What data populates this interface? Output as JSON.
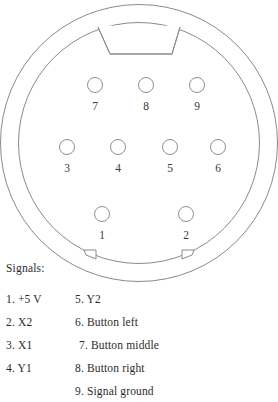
{
  "diagram": {
    "colors": {
      "outline": "#8a8a8a",
      "pin_outline": "#909090",
      "background": "#ffffff",
      "text": "#2b2b2b"
    },
    "shell": {
      "outer_circle": {
        "cx": 139,
        "cy": 143,
        "r": 139
      },
      "inner_circle": {
        "cx": 139,
        "cy": 143,
        "r": 121
      },
      "keyway_notch": "trapezoid-top",
      "bottom_tabs": 2
    },
    "pins": [
      {
        "number": "1",
        "cx": 102,
        "cy": 214
      },
      {
        "number": "2",
        "cx": 186,
        "cy": 214
      },
      {
        "number": "3",
        "cx": 67,
        "cy": 147
      },
      {
        "number": "4",
        "cx": 118,
        "cy": 147
      },
      {
        "number": "5",
        "cx": 170,
        "cy": 147
      },
      {
        "number": "6",
        "cx": 218,
        "cy": 147
      },
      {
        "number": "7",
        "cx": 95,
        "cy": 85
      },
      {
        "number": "8",
        "cx": 146,
        "cy": 85
      },
      {
        "number": "9",
        "cx": 197,
        "cy": 85
      }
    ],
    "pin_radius": 7.5
  },
  "legend": {
    "heading": "Signals:",
    "left_column": [
      "1. +5 V",
      "2. X2",
      "3. X1",
      "4. Y1"
    ],
    "right_column": [
      "5. Y2",
      "6. Button left",
      "7. Button middle",
      "8. Button right",
      "9. Signal ground"
    ]
  }
}
